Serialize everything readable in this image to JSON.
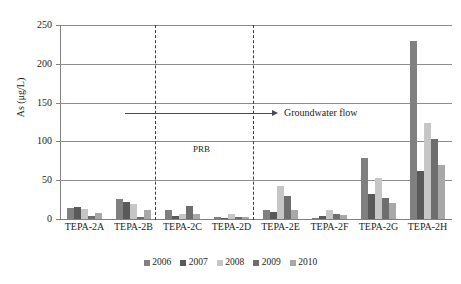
{
  "chart_data": {
    "type": "bar",
    "title": "",
    "xlabel": "",
    "ylabel": "As (μg/L)",
    "ylim": [
      0,
      250
    ],
    "yticks": [
      0,
      50,
      100,
      150,
      200,
      250
    ],
    "grid": true,
    "legend_position": "bottom",
    "categories": [
      "TEPA-2A",
      "TEPA-2B",
      "TEPA-2C",
      "TEPA-2D",
      "TEPA-2E",
      "TEPA-2F",
      "TEPA-2G",
      "TEPA-2H"
    ],
    "series": [
      {
        "name": "2006",
        "color": "#808080",
        "values": [
          14,
          26,
          12,
          2,
          11,
          1,
          79,
          230
        ]
      },
      {
        "name": "2007",
        "color": "#595959",
        "values": [
          16,
          22,
          4,
          1,
          9,
          4,
          32,
          62
        ]
      },
      {
        "name": "2008",
        "color": "#c6c6c6",
        "values": [
          13,
          19,
          7,
          6,
          42,
          12,
          53,
          124
        ]
      },
      {
        "name": "2009",
        "color": "#6e6e6e",
        "values": [
          4,
          2,
          17,
          2,
          30,
          7,
          27,
          103
        ]
      },
      {
        "name": "2010",
        "color": "#a8a8a8",
        "values": [
          8,
          12,
          6,
          2,
          11,
          5,
          20,
          69
        ]
      }
    ],
    "annotations": [
      {
        "name": "groundwater-flow",
        "text": "Groundwater flow",
        "value": 137
      },
      {
        "name": "prb-zone",
        "text": "PRB"
      }
    ]
  },
  "legend": {
    "items": [
      {
        "label": "2006",
        "color": "#808080"
      },
      {
        "label": "2007",
        "color": "#595959"
      },
      {
        "label": "2008",
        "color": "#c6c6c6"
      },
      {
        "label": "2009",
        "color": "#6e6e6e"
      },
      {
        "label": "2010",
        "color": "#a8a8a8"
      }
    ]
  }
}
